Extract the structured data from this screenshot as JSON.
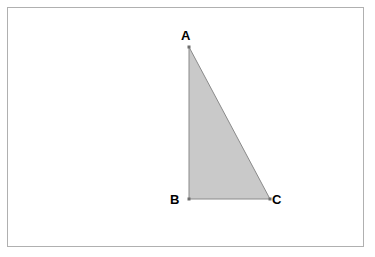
{
  "figure": {
    "type": "geometric-diagram",
    "shape": "right-triangle",
    "background_color": "#ffffff",
    "frame": {
      "border_color": "#b0b0b0",
      "border_width": 1
    },
    "triangle": {
      "fill_color": "#c9c9c9",
      "stroke_color": "#8a8a8a",
      "stroke_width": 1,
      "vertices": [
        {
          "label": "A",
          "x": 189,
          "y": 47
        },
        {
          "label": "B",
          "x": 189,
          "y": 199
        },
        {
          "label": "C",
          "x": 270,
          "y": 199
        }
      ],
      "points_path": "189,47 189,199 270,199"
    },
    "labels": {
      "a": "A",
      "b": "B",
      "c": "C"
    }
  }
}
